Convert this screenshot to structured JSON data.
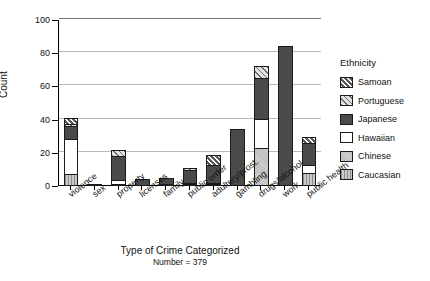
{
  "chart_data": {
    "type": "bar",
    "subtype": "stacked-bar",
    "title": "",
    "xlabel": "Type of Crime Categorized",
    "xlabel_sub": "Number = 379",
    "ylabel": "Count",
    "ylim": [
      0,
      100
    ],
    "yticks": [
      0,
      20,
      40,
      60,
      80,
      100
    ],
    "grid": true,
    "legend_position": "right",
    "legend_title": "Ethnicity",
    "stack_order_bottom_to_top": [
      "Caucasian",
      "Chinese",
      "Hawaiian",
      "Japanese",
      "Portuguese",
      "Samoan"
    ],
    "categories": [
      "violence",
      "sex",
      "property",
      "licenses",
      "family",
      "public order",
      "adultery/prost.",
      "gambling",
      "drugs/alcohol",
      "work",
      "public health"
    ],
    "series": [
      {
        "name": "Caucasian",
        "values": [
          7,
          0,
          1,
          0,
          0,
          1,
          1,
          0,
          0,
          0,
          8
        ]
      },
      {
        "name": "Chinese",
        "values": [
          0,
          0,
          0,
          0,
          0,
          0,
          0,
          0,
          23,
          0,
          0
        ]
      },
      {
        "name": "Hawaiian",
        "values": [
          22,
          1,
          3,
          0,
          1,
          1,
          1,
          0,
          18,
          0,
          5
        ]
      },
      {
        "name": "Japanese",
        "values": [
          8,
          0,
          15,
          4,
          4,
          8,
          11,
          34,
          25,
          84,
          14
        ]
      },
      {
        "name": "Portuguese",
        "values": [
          2,
          0,
          4,
          0,
          0,
          2,
          0,
          0,
          8,
          0,
          0
        ]
      },
      {
        "name": "Samoan",
        "values": [
          4,
          0,
          0,
          0,
          0,
          0,
          7,
          0,
          0,
          0,
          4
        ]
      }
    ],
    "totals": [
      43,
      1,
      23,
      4,
      5,
      12,
      20,
      34,
      74,
      84,
      31
    ]
  },
  "legend": {
    "title": "Ethnicity",
    "entries": [
      {
        "label": "Samoan",
        "fill": "samoan"
      },
      {
        "label": "Portuguese",
        "fill": "portuguese"
      },
      {
        "label": "Japanese",
        "fill": "japanese"
      },
      {
        "label": "Hawaiian",
        "fill": "hawaiian"
      },
      {
        "label": "Chinese",
        "fill": "chinese"
      },
      {
        "label": "Caucasian",
        "fill": "caucasian"
      }
    ]
  },
  "colors": {
    "japanese": "#4a4a4a",
    "hawaiian": "#ffffff",
    "chinese": "#cfcfcf",
    "caucasian": "#c9c9c9",
    "portuguese": "#e2e2e2",
    "samoan": "#5a5a5a",
    "grid": "#b9b9b9",
    "axis": "#000000"
  }
}
